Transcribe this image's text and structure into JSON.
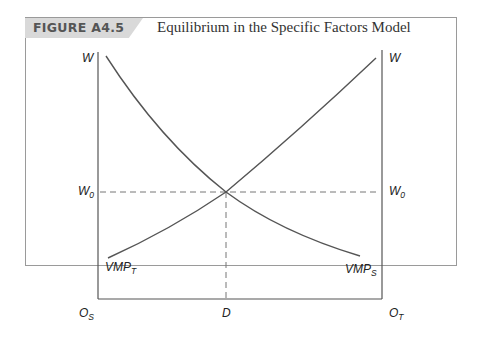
{
  "figure": {
    "tag": "FIGURE A4.5",
    "title": "Equilibrium in the Specific Factors Model"
  },
  "axes": {
    "left_y_label": "W",
    "right_y_label": "W",
    "left_w0": "W",
    "left_w0_sub": "0",
    "right_w0": "W",
    "right_w0_sub": "0",
    "origin_left": "O",
    "origin_left_sub": "S",
    "origin_right": "O",
    "origin_right_sub": "T",
    "equilibrium_x": "D"
  },
  "curves": {
    "vmp_t_label": "VMP",
    "vmp_t_sub": "T",
    "vmp_s_label": "VMP",
    "vmp_s_sub": "S"
  },
  "colors": {
    "header_tab": "#d9d9d9",
    "line": "#555555",
    "frame": "#9a9a9a"
  }
}
